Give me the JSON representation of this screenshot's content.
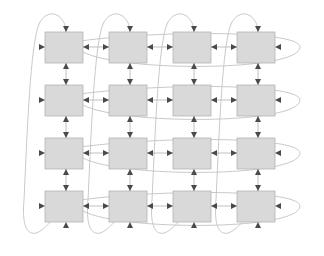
{
  "diagram": {
    "type": "torus-mesh-topology",
    "grid": {
      "rows": 4,
      "cols": 4,
      "node_count": 16
    },
    "colors": {
      "node_fill": "#d9d9d9",
      "node_stroke": "#b5b5b5",
      "link_stroke": "#b9b9b9",
      "wrap_stroke": "#c3c3c3",
      "arrow_fill": "#4a4a4a",
      "background": "#ffffff"
    },
    "geometry": {
      "node_width": 38,
      "node_height": 31,
      "col_pitch": 64,
      "row_pitch": 53,
      "origin_x": 45,
      "origin_y": 32
    },
    "nodes": [
      {
        "id": "n00",
        "row": 0,
        "col": 0,
        "label": ""
      },
      {
        "id": "n01",
        "row": 0,
        "col": 1,
        "label": ""
      },
      {
        "id": "n02",
        "row": 0,
        "col": 2,
        "label": ""
      },
      {
        "id": "n03",
        "row": 0,
        "col": 3,
        "label": ""
      },
      {
        "id": "n10",
        "row": 1,
        "col": 0,
        "label": ""
      },
      {
        "id": "n11",
        "row": 1,
        "col": 1,
        "label": ""
      },
      {
        "id": "n12",
        "row": 1,
        "col": 2,
        "label": ""
      },
      {
        "id": "n13",
        "row": 1,
        "col": 3,
        "label": ""
      },
      {
        "id": "n20",
        "row": 2,
        "col": 0,
        "label": ""
      },
      {
        "id": "n21",
        "row": 2,
        "col": 1,
        "label": ""
      },
      {
        "id": "n22",
        "row": 2,
        "col": 2,
        "label": ""
      },
      {
        "id": "n23",
        "row": 2,
        "col": 3,
        "label": ""
      },
      {
        "id": "n30",
        "row": 3,
        "col": 0,
        "label": ""
      },
      {
        "id": "n31",
        "row": 3,
        "col": 1,
        "label": ""
      },
      {
        "id": "n32",
        "row": 3,
        "col": 2,
        "label": ""
      },
      {
        "id": "n33",
        "row": 3,
        "col": 3,
        "label": ""
      }
    ],
    "link_style": {
      "bidirectional": true,
      "arrowheads": "both-ends-inward"
    },
    "wraparound": {
      "horizontal_rows": [
        0,
        1,
        2,
        3
      ],
      "vertical_cols": [
        0,
        1,
        2,
        3
      ],
      "description": "Edge nodes connect to opposite edge via looping arcs"
    }
  }
}
